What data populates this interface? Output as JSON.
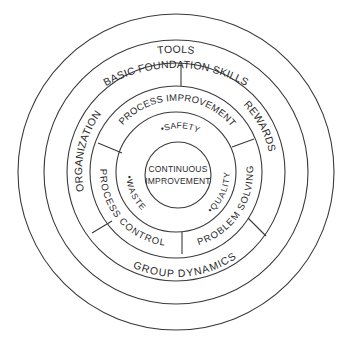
{
  "diagram": {
    "center": {
      "line1": "CONTINUOUS",
      "line2": "IMPROVEMENT"
    },
    "inner_ring": {
      "items": [
        "•SAFETY",
        "•WASTE",
        "•QUALITY"
      ]
    },
    "process_ring": {
      "sections": [
        "PROCESS IMPROVEMENT",
        "PROCESS CONTROL",
        "PROBLEM SOLVING"
      ]
    },
    "support_ring": {
      "sections": [
        "TOOLS",
        "ORGANIZATION",
        "REWARDS",
        "GROUP DYNAMICS"
      ]
    },
    "foundation_ring": {
      "label": "BASIC FOUNDATION SKILLS"
    },
    "colors": {
      "line": "#3a3a3a",
      "text": "#2a2a2a",
      "background": "#ffffff"
    }
  }
}
